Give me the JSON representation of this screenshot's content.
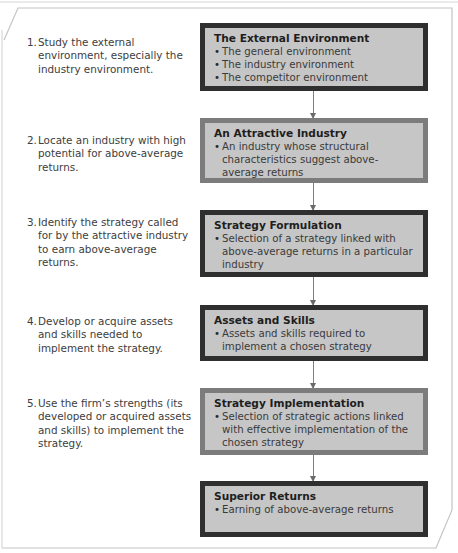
{
  "steps": [
    {
      "number": "1.",
      "text": "Study the external environment, especially the industry environment."
    },
    {
      "number": "2.",
      "text": "Locate an industry with high potential for above-average returns."
    },
    {
      "number": "3.",
      "text": "Identify the strategy called for by the attractive industry to earn above-average returns."
    },
    {
      "number": "4.",
      "text": "Develop or acquire assets and skills needed to implement the strategy."
    },
    {
      "number": "5.",
      "text": "Use the firm’s strengths (its developed or acquired assets and skills) to implement the strategy."
    }
  ],
  "boxes": [
    {
      "title": "The External Environment",
      "bullets": [
        "The general environment",
        "The industry environment",
        "The competitor environment"
      ]
    },
    {
      "title": "An Attractive Industry",
      "bullets": [
        "An industry whose structural characteristics suggest above-average returns"
      ]
    },
    {
      "title": "Strategy Formulation",
      "bullets": [
        "Selection of a strategy linked with above-average returns in a particular industry"
      ]
    },
    {
      "title": "Assets and Skills",
      "bullets": [
        "Assets and skills required to implement a chosen strategy"
      ]
    },
    {
      "title": "Strategy Implementation",
      "bullets": [
        "Selection of strategic actions linked with effective implementation of the chosen strategy"
      ]
    },
    {
      "title": "Superior Returns",
      "bullets": [
        "Earning of above-average returns"
      ]
    }
  ],
  "colors": {
    "box_fill": "#c6c6c6",
    "border_dark": "#2f2f2f",
    "border_mid": "#7c7c7c",
    "frame": "#bdbdbd"
  }
}
